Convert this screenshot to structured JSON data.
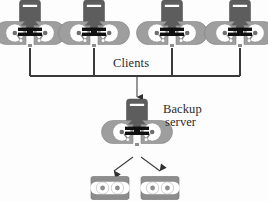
{
  "diagram": {
    "background_color": "#fdfdfd",
    "line_color": "#3a3a3a",
    "labels": {
      "clients": "Clients",
      "backup_server_line1": "Backup",
      "backup_server_line2": "server"
    },
    "colors": {
      "tower_dark": "#5a5a5a",
      "tower_slot": "#ffffff",
      "disk_body": "#9a9a9a",
      "disk_platter": "#ffffff",
      "bar_black": "#111111",
      "tape_body": "#8d8d8d",
      "tape_reel": "#ffffff",
      "stroke": "#3a3a3a"
    },
    "clients": [
      {
        "name": "client-1",
        "x": 30,
        "y": 28
      },
      {
        "name": "client-2",
        "x": 94,
        "y": 28
      },
      {
        "name": "client-3",
        "x": 172,
        "y": 28
      },
      {
        "name": "client-4",
        "x": 240,
        "y": 28
      }
    ],
    "server": {
      "name": "backup-server",
      "x": 137,
      "y": 127
    },
    "tapes": [
      {
        "name": "tape-cartridge-1",
        "x": 110,
        "y": 188
      },
      {
        "name": "tape-cartridge-2",
        "x": 160,
        "y": 188
      }
    ],
    "connections": {
      "bus_y": 76,
      "bus_x_start": 30,
      "bus_x_end": 240,
      "drop_to_server_x": 137,
      "drop_to_server_y_end": 98,
      "tape_arrows": 2
    }
  }
}
